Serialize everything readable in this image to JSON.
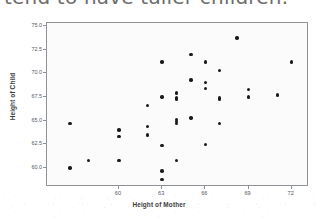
{
  "caption": {
    "text": "tend to have taller children."
  },
  "chart_data": {
    "type": "scatter",
    "title": "",
    "xlabel": "Height of Mother",
    "ylabel": "Height of Child",
    "xlim": [
      55.0,
      73.2
    ],
    "ylim": [
      58.0,
      75.3
    ],
    "xticks": [
      60,
      63,
      66,
      69,
      72
    ],
    "xtick_labels": [
      "60",
      "63",
      "66",
      "69",
      "72"
    ],
    "yticks": [
      60.0,
      62.5,
      65.0,
      67.5,
      70.0,
      72.5,
      75.0
    ],
    "ytick_labels": [
      "60.0",
      "62.5",
      "65.0",
      "67.5",
      "70.0",
      "72.5",
      "75.0"
    ],
    "grid": false,
    "legend": null,
    "marker_color": "#1b1b1b",
    "frame_color": "#8e9296",
    "plot_background": "#fbfbfb",
    "points": [
      {
        "x": 56.6,
        "y": 64.7
      },
      {
        "x": 57.9,
        "y": 60.8
      },
      {
        "x": 56.6,
        "y": 60.0
      },
      {
        "x": 60.0,
        "y": 64.0
      },
      {
        "x": 60.0,
        "y": 63.3
      },
      {
        "x": 60.0,
        "y": 60.8
      },
      {
        "x": 62.0,
        "y": 66.6
      },
      {
        "x": 62.0,
        "y": 64.4
      },
      {
        "x": 62.0,
        "y": 63.5
      },
      {
        "x": 63.0,
        "y": 71.2
      },
      {
        "x": 63.0,
        "y": 67.5
      },
      {
        "x": 63.0,
        "y": 62.4
      },
      {
        "x": 63.0,
        "y": 59.7
      },
      {
        "x": 63.0,
        "y": 58.8
      },
      {
        "x": 64.0,
        "y": 67.9
      },
      {
        "x": 64.0,
        "y": 67.4
      },
      {
        "x": 64.0,
        "y": 67.3
      },
      {
        "x": 64.0,
        "y": 65.1
      },
      {
        "x": 64.0,
        "y": 64.9
      },
      {
        "x": 64.0,
        "y": 64.7
      },
      {
        "x": 64.0,
        "y": 60.8
      },
      {
        "x": 65.0,
        "y": 72.0
      },
      {
        "x": 65.0,
        "y": 69.3
      },
      {
        "x": 65.0,
        "y": 65.3
      },
      {
        "x": 66.0,
        "y": 71.2
      },
      {
        "x": 66.0,
        "y": 69.0
      },
      {
        "x": 66.0,
        "y": 68.4
      },
      {
        "x": 66.0,
        "y": 62.5
      },
      {
        "x": 67.0,
        "y": 70.3
      },
      {
        "x": 67.0,
        "y": 67.4
      },
      {
        "x": 67.0,
        "y": 67.2
      },
      {
        "x": 67.0,
        "y": 64.7
      },
      {
        "x": 68.2,
        "y": 73.7
      },
      {
        "x": 69.0,
        "y": 68.3
      },
      {
        "x": 69.0,
        "y": 67.5
      },
      {
        "x": 71.0,
        "y": 67.7
      },
      {
        "x": 72.0,
        "y": 71.2
      }
    ]
  }
}
